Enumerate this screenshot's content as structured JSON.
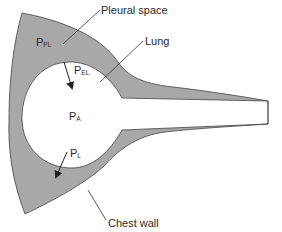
{
  "diagram": {
    "colors": {
      "tissue_fill": "#a8a8a8",
      "outline": "#444444",
      "background": "#ffffff",
      "text": "#2a2a2a"
    },
    "labels": {
      "pleural_space": "Pleural space",
      "lung": "Lung",
      "chest_wall": "Chest wall"
    },
    "pressures": {
      "ppl": {
        "main": "P",
        "sub": "PL"
      },
      "pel": {
        "main": "P",
        "sub": "EL"
      },
      "pa": {
        "main": "P",
        "sub": "A"
      },
      "pl": {
        "main": "P",
        "sub": "L"
      }
    }
  }
}
